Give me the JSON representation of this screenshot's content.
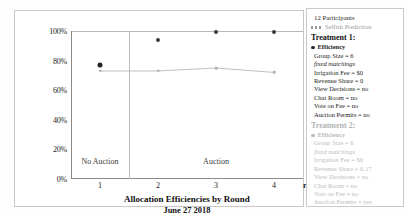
{
  "chart_data": {
    "type": "scatter",
    "title": "Allocation Efficiencies by Round",
    "subtitle": "June 27 2018",
    "xlabel": "round",
    "ylabel": "",
    "xlim": [
      0.5,
      4.5
    ],
    "ylim": [
      0,
      100
    ],
    "grid": false,
    "x": [
      1,
      2,
      3,
      4
    ],
    "xticklabels": [
      "1",
      "2",
      "3",
      "4"
    ],
    "yticklabels": [
      "0%",
      "20%",
      "40%",
      "60%",
      "80%",
      "100%"
    ],
    "yticks": [
      0,
      20,
      40,
      60,
      80,
      100
    ],
    "regions": [
      {
        "label": "No Auction",
        "from": 0.5,
        "to": 1.5
      },
      {
        "label": "Auction",
        "from": 1.5,
        "to": 4.5
      }
    ],
    "region_divider_x": 1.5,
    "series": [
      {
        "name": "Efficiency",
        "type": "scatter",
        "color": "#3b3b3b",
        "values": [
          77,
          94,
          99,
          99
        ]
      },
      {
        "name": "Selfish Prediction",
        "type": "line",
        "color": "#b0b0b0",
        "values": [
          73,
          73,
          75,
          72
        ]
      }
    ]
  },
  "chart": {
    "title": "Allocation Efficiencies by Round",
    "subtitle": "June 27 2018",
    "x_axis_name": "round",
    "yticks": [
      "100%",
      "80%",
      "60%",
      "40%",
      "20%",
      "0%"
    ],
    "xticks": [
      "1",
      "2",
      "3",
      "4"
    ],
    "region_no_auction": "No Auction",
    "region_auction": "Auction"
  },
  "legend": {
    "participants": "12 Participants",
    "prediction_label": "Selfish Prediction",
    "treatments": [
      {
        "heading": "Treatment 1:",
        "series_label": "Efficiency",
        "active": true,
        "rows": [
          "Group Size = 6",
          "fixed matchings",
          "Irrigation Fee = $0",
          "Revenue Share = 0",
          "View Decisions = no",
          "Chat Room = no",
          "Vote on Fee = no",
          "Auction Permits = no"
        ]
      },
      {
        "heading": "Treatment 2:",
        "series_label": "Efficiency",
        "active": false,
        "rows": [
          "Group Size = 6",
          "fixed matchings",
          "Irrigation Fee = $0",
          "Revenue Share = 0.17",
          "View Decisions = no",
          "Chat Room = no",
          "Vote on Fee = no",
          "Auction Permits = yes"
        ]
      }
    ]
  }
}
